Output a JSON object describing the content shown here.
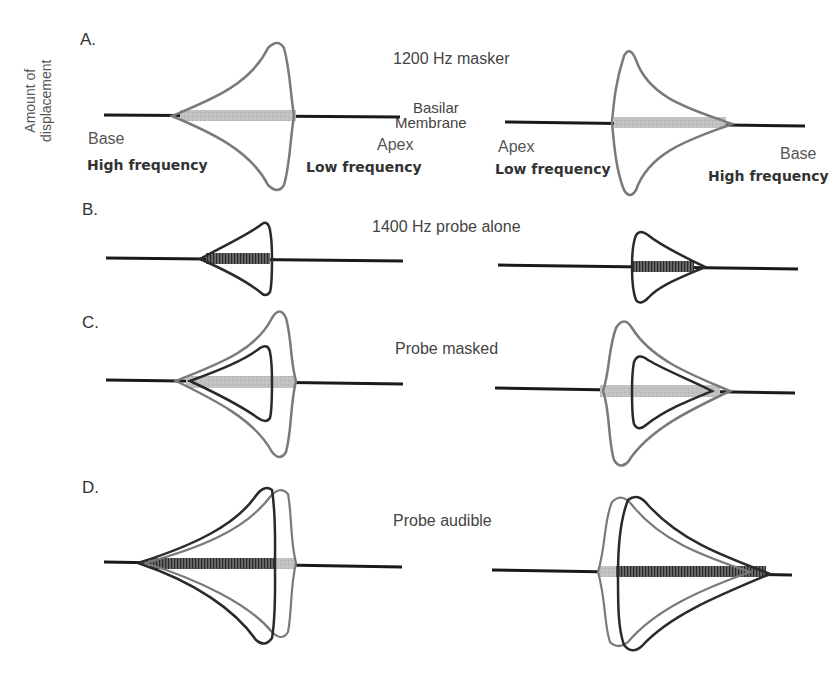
{
  "figure": {
    "y_axis_label_line1": "Amount of",
    "y_axis_label_line2": "displacement",
    "membrane_label_line1": "Basilar",
    "membrane_label_line2": "Membrane",
    "colors": {
      "membrane": "#1a1a1a",
      "masker_outline": "#7a7a7a",
      "masker_fill": "#c4c4c4",
      "probe_outline": "#2a2a2a",
      "probe_fill": "#555555"
    }
  },
  "panels": [
    {
      "letter": "A.",
      "title": "1200 Hz masker",
      "left": {
        "left_end_label": "Base",
        "left_end_sublabel": "High frequency",
        "right_end_label": "Apex",
        "right_end_sublabel": "Low frequency"
      },
      "right": {
        "left_end_label": "Apex",
        "left_end_sublabel": "Low frequency",
        "right_end_label": "Base",
        "right_end_sublabel": "High frequency"
      }
    },
    {
      "letter": "B.",
      "title": "1400 Hz probe alone"
    },
    {
      "letter": "C.",
      "title": "Probe masked"
    },
    {
      "letter": "D.",
      "title": "Probe audible"
    }
  ]
}
